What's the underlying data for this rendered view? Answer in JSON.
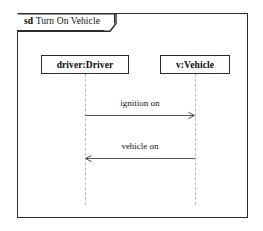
{
  "diagram": {
    "kind": "uml-sequence-diagram",
    "frame": {
      "keyword": "sd",
      "name": "Turn On Vehicle"
    },
    "lifelines": [
      {
        "id": "driver",
        "label": "driver:Driver"
      },
      {
        "id": "vehicle",
        "label": "v:Vehicle"
      }
    ],
    "messages": [
      {
        "id": "ignition-on",
        "label": "ignition on",
        "from": "driver",
        "to": "vehicle",
        "direction": "left-to-right"
      },
      {
        "id": "vehicle-on",
        "label": "vehicle on",
        "from": "vehicle",
        "to": "driver",
        "direction": "right-to-left"
      }
    ],
    "colors": {
      "frame_border": "#2b2b2b",
      "box_border": "#2b2b2b",
      "lifeline": "#b9b9b9",
      "arrow": "#5a5a5a",
      "text": "#111111",
      "background": "#ffffff"
    }
  }
}
